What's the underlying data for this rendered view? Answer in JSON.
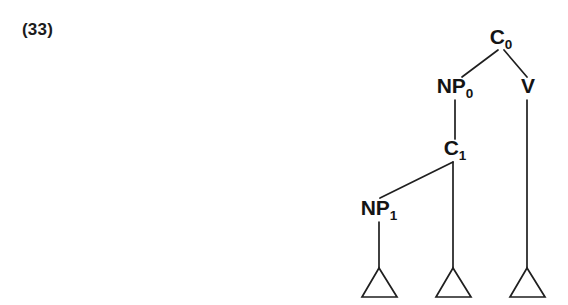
{
  "figure": {
    "example_number": "(33)",
    "background_color": "#ffffff",
    "ink_color": "#1f1f1f",
    "type": "syntax-tree-diagram"
  },
  "tree": {
    "nodes": [
      {
        "id": "c0",
        "base": "C",
        "sub": "0",
        "x": 501,
        "y": 44
      },
      {
        "id": "np0",
        "base": "NP",
        "sub": "0",
        "x": 455,
        "y": 93
      },
      {
        "id": "v",
        "base": "V",
        "sub": "",
        "x": 528,
        "y": 93
      },
      {
        "id": "c1",
        "base": "C",
        "sub": "1",
        "x": 455,
        "y": 155
      },
      {
        "id": "np1",
        "base": "NP",
        "sub": "1",
        "x": 379,
        "y": 215
      }
    ],
    "branches": [
      {
        "from": "c0",
        "to": "np0",
        "x1": 498,
        "y1": 50,
        "x2": 462,
        "y2": 77
      },
      {
        "from": "c0",
        "to": "v",
        "x1": 504,
        "y1": 50,
        "x2": 527,
        "y2": 77
      },
      {
        "from": "np0",
        "to": "c1",
        "x1": 455,
        "y1": 100,
        "x2": 455,
        "y2": 139
      },
      {
        "from": "c1",
        "to": "np1",
        "x1": 453,
        "y1": 162,
        "x2": 380,
        "y2": 198
      },
      {
        "from": "c1",
        "to": "tri2",
        "x1": 453,
        "y1": 162,
        "x2": 453,
        "y2": 268
      },
      {
        "from": "v",
        "to": "tri3",
        "x1": 527,
        "y1": 100,
        "x2": 527,
        "y2": 268
      },
      {
        "from": "np1",
        "to": "tri1",
        "x1": 379,
        "y1": 222,
        "x2": 379,
        "y2": 268
      }
    ],
    "triangles": [
      {
        "id": "tri1",
        "apex_x": 379,
        "apex_y": 268,
        "left_x": 362,
        "right_x": 397,
        "base_y": 297
      },
      {
        "id": "tri2",
        "apex_x": 453,
        "apex_y": 268,
        "left_x": 436,
        "right_x": 471,
        "base_y": 297
      },
      {
        "id": "tri3",
        "apex_x": 527,
        "apex_y": 268,
        "left_x": 510,
        "right_x": 545,
        "base_y": 297
      }
    ]
  }
}
